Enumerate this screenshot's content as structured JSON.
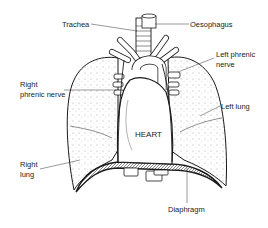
{
  "diagram": {
    "labels": {
      "trachea": "Trachea",
      "oesophagus": "Oesophagus",
      "left_phrenic_1": "Left phrenic",
      "left_phrenic_2": "nerve",
      "right_phrenic_1": "Right",
      "right_phrenic_2": "phrenic nerve",
      "left_lung": "Left lung",
      "heart": "HEART",
      "right_lung_1": "Right",
      "right_lung_2": "lung",
      "diaphragm": "Diaphragm"
    },
    "colors": {
      "ink": "#1a1a1a",
      "background": "#ffffff"
    }
  }
}
